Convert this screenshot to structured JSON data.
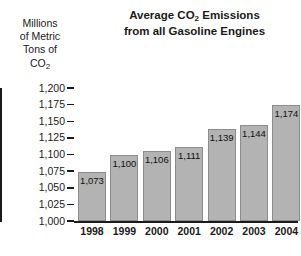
{
  "chart_data": {
    "type": "bar",
    "title_lines": [
      "Average CO2 Emissions",
      "from all Gasoline Engines"
    ],
    "title_line1_pre": "Average CO",
    "title_line1_sub": "2",
    "title_line1_post": " Emissions",
    "title_line2": "from all Gasoline Engines",
    "ylabel_lines": [
      "Millions",
      "of Metric",
      "Tons of",
      "CO"
    ],
    "ylabel_last_sub": "2",
    "xlabel": "",
    "ylabel": "Millions of Metric Tons of CO2",
    "categories": [
      "1998",
      "1999",
      "2000",
      "2001",
      "2002",
      "2003",
      "2004"
    ],
    "values": [
      1073,
      1100,
      1106,
      1111,
      1139,
      1144,
      1174
    ],
    "value_labels": [
      "1,073",
      "1,100",
      "1,106",
      "1,111",
      "1,139",
      "1,144",
      "1,174"
    ],
    "ylim": [
      1000,
      1200
    ],
    "ytick_step": 25,
    "yticks": [
      1200,
      1175,
      1150,
      1125,
      1100,
      1075,
      1050,
      1025,
      1000
    ],
    "ytick_labels": [
      "1,200",
      "1,175",
      "1,150",
      "1,125",
      "1,100",
      "1,075",
      "1,050",
      "1,025",
      "1,000"
    ],
    "grid": false,
    "legend": null,
    "bar_color": "#b3b3b3",
    "bar_border_color": "#8c8c8c",
    "axis_color": "#1a1a1a",
    "background_color": "#ffffff"
  }
}
